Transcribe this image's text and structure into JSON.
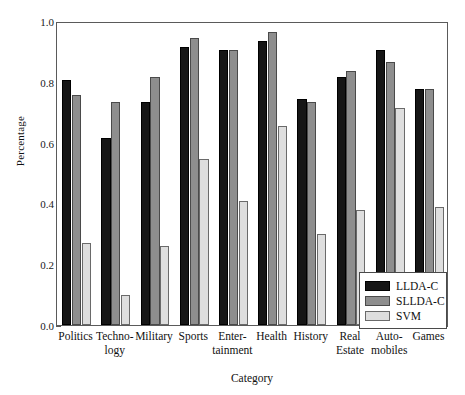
{
  "chart_data": {
    "type": "bar",
    "title": "",
    "xlabel": "Category",
    "ylabel": "Percentage",
    "ylim": [
      0.0,
      1.0
    ],
    "yticks": [
      "0.0",
      "0.2",
      "0.4",
      "0.6",
      "0.8",
      "1.0"
    ],
    "ytick_values": [
      0.0,
      0.2,
      0.4,
      0.6,
      0.8,
      1.0
    ],
    "grid": false,
    "legend_position": "lower right",
    "categories": [
      "Politics",
      "Techno-\nlogy",
      "Military",
      "Sports",
      "Enter-\ntainment",
      "Health",
      "History",
      "Real\nEstate",
      "Auto-\nmobiles",
      "Games"
    ],
    "category_lines": [
      [
        "Politics"
      ],
      [
        "Techno-",
        "logy"
      ],
      [
        "Military"
      ],
      [
        "Sports"
      ],
      [
        "Enter-",
        "tainment"
      ],
      [
        "Health"
      ],
      [
        "History"
      ],
      [
        "Real",
        "Estate"
      ],
      [
        "Auto-",
        "mobiles"
      ],
      [
        "Games"
      ]
    ],
    "series": [
      {
        "name": "LLDA-C",
        "color": "#161616",
        "values": [
          0.81,
          0.62,
          0.74,
          0.92,
          0.91,
          0.94,
          0.75,
          0.82,
          0.91,
          0.78
        ]
      },
      {
        "name": "SLLDA-C",
        "color": "#8e8e8e",
        "values": [
          0.76,
          0.74,
          0.82,
          0.95,
          0.91,
          0.97,
          0.74,
          0.84,
          0.87,
          0.78
        ]
      },
      {
        "name": "SVM",
        "color": "#dedede",
        "values": [
          0.27,
          0.1,
          0.26,
          0.55,
          0.41,
          0.66,
          0.3,
          0.38,
          0.72,
          0.39
        ]
      }
    ]
  },
  "legend": {
    "items": [
      {
        "label": "LLDA-C"
      },
      {
        "label": "SLLDA-C"
      },
      {
        "label": "SVM"
      }
    ]
  }
}
